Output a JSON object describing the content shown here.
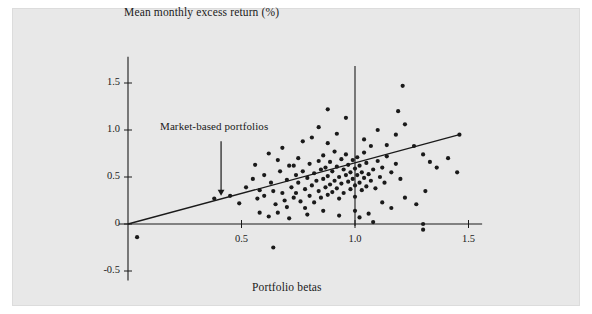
{
  "figure": {
    "background_color": "#e8e8e8",
    "page_color": "#ffffff",
    "ink_color": "#1a1a1a"
  },
  "labels": {
    "ylabel": "Mean monthly excess return (%)",
    "xlabel": "Portfolio betas",
    "annotation": "Market-based portfolios"
  },
  "chart_data": {
    "type": "scatter",
    "title": "",
    "xlabel": "Portfolio betas",
    "ylabel": "Mean monthly excess return (%)",
    "xlim": [
      -0.05,
      1.62
    ],
    "ylim": [
      -0.62,
      1.72
    ],
    "grid": false,
    "legend": null,
    "xticks": [
      0.5,
      1.0,
      1.5
    ],
    "xtick_labels": [
      "0.5",
      "1.0",
      "1.5"
    ],
    "yticks": [
      -0.5,
      0,
      0.5,
      1.0,
      1.5
    ],
    "ytick_labels": [
      "-0.5",
      "0",
      "0.5",
      "1.0",
      "1.5"
    ],
    "annotations": [
      {
        "text": "Market-based portfolios",
        "arrow_x": 0.41,
        "arrow_y_top": 0.88,
        "arrow_y_tip": 0.3
      }
    ],
    "reference_lines": [
      {
        "name": "market-beta-line",
        "orientation": "vertical",
        "x": 1.0,
        "y_from": -0.02,
        "y_to": 1.68
      },
      {
        "name": "x-axis",
        "orientation": "horizontal",
        "y": 0.0,
        "x_from": -0.04,
        "x_to": 1.56
      },
      {
        "name": "y-axis",
        "orientation": "vertical",
        "x": 0.0,
        "y_from": -0.6,
        "y_to": 1.78
      }
    ],
    "fit_line": {
      "name": "regression-line",
      "x_from": 0.0,
      "y_from": 0.0,
      "x_to": 1.46,
      "y_to": 0.95,
      "slope": 0.65,
      "intercept": 0.0
    },
    "points": [
      [
        0.04,
        -0.14
      ],
      [
        0.38,
        0.27
      ],
      [
        0.45,
        0.3
      ],
      [
        0.49,
        0.22
      ],
      [
        0.58,
        0.36
      ],
      [
        0.6,
        0.3
      ],
      [
        0.63,
        0.44
      ],
      [
        0.64,
        0.35
      ],
      [
        0.65,
        0.21
      ],
      [
        0.66,
        0.12
      ],
      [
        0.67,
        0.56
      ],
      [
        0.68,
        0.33
      ],
      [
        0.69,
        0.25
      ],
      [
        0.7,
        0.47
      ],
      [
        0.7,
        0.18
      ],
      [
        0.71,
        0.62
      ],
      [
        0.72,
        0.39
      ],
      [
        0.73,
        0.28
      ],
      [
        0.74,
        0.52
      ],
      [
        0.74,
        0.33
      ],
      [
        0.75,
        0.7
      ],
      [
        0.75,
        0.44
      ],
      [
        0.76,
        0.24
      ],
      [
        0.77,
        0.56
      ],
      [
        0.78,
        0.37
      ],
      [
        0.78,
        0.17
      ],
      [
        0.79,
        0.49
      ],
      [
        0.8,
        0.64
      ],
      [
        0.8,
        0.3
      ],
      [
        0.81,
        0.41
      ],
      [
        0.82,
        0.54
      ],
      [
        0.82,
        0.23
      ],
      [
        0.83,
        0.46
      ],
      [
        0.84,
        0.67
      ],
      [
        0.84,
        0.35
      ],
      [
        0.85,
        0.58
      ],
      [
        0.85,
        0.28
      ],
      [
        0.86,
        0.48
      ],
      [
        0.86,
        0.73
      ],
      [
        0.87,
        0.39
      ],
      [
        0.87,
        0.6
      ],
      [
        0.88,
        0.31
      ],
      [
        0.88,
        0.51
      ],
      [
        0.89,
        0.42
      ],
      [
        0.89,
        0.66
      ],
      [
        0.9,
        0.56
      ],
      [
        0.9,
        0.34
      ],
      [
        0.91,
        0.46
      ],
      [
        0.91,
        0.77
      ],
      [
        0.92,
        0.61
      ],
      [
        0.92,
        0.38
      ],
      [
        0.93,
        0.5
      ],
      [
        0.93,
        0.27
      ],
      [
        0.94,
        0.69
      ],
      [
        0.94,
        0.43
      ],
      [
        0.95,
        0.58
      ],
      [
        0.95,
        0.33
      ],
      [
        0.96,
        0.52
      ],
      [
        0.96,
        0.74
      ],
      [
        0.97,
        0.45
      ],
      [
        0.97,
        0.63
      ],
      [
        0.98,
        0.37
      ],
      [
        0.98,
        0.55
      ],
      [
        0.99,
        0.48
      ],
      [
        0.99,
        0.68
      ],
      [
        1.0,
        0.41
      ],
      [
        1.0,
        0.59
      ],
      [
        1.0,
        0.29
      ],
      [
        1.01,
        0.52
      ],
      [
        1.01,
        0.71
      ],
      [
        1.02,
        0.44
      ],
      [
        1.02,
        0.62
      ],
      [
        1.03,
        0.36
      ],
      [
        1.03,
        0.55
      ],
      [
        1.04,
        0.49
      ],
      [
        1.04,
        0.76
      ],
      [
        1.05,
        0.4
      ],
      [
        1.05,
        0.65
      ],
      [
        1.06,
        0.53
      ],
      [
        1.07,
        0.46
      ],
      [
        1.07,
        0.83
      ],
      [
        1.08,
        0.58
      ],
      [
        1.09,
        0.38
      ],
      [
        1.1,
        0.67
      ],
      [
        1.11,
        0.5
      ],
      [
        1.12,
        0.6
      ],
      [
        1.13,
        0.44
      ],
      [
        1.14,
        0.72
      ],
      [
        1.16,
        0.55
      ],
      [
        1.18,
        0.64
      ],
      [
        1.2,
        0.48
      ],
      [
        0.62,
        0.75
      ],
      [
        0.68,
        0.81
      ],
      [
        0.77,
        0.88
      ],
      [
        0.81,
        0.92
      ],
      [
        0.88,
        0.86
      ],
      [
        0.92,
        0.96
      ],
      [
        0.84,
        1.03
      ],
      [
        0.96,
        1.13
      ],
      [
        0.88,
        1.22
      ],
      [
        1.04,
        0.9
      ],
      [
        1.1,
        1.0
      ],
      [
        1.14,
        0.84
      ],
      [
        1.18,
        0.95
      ],
      [
        1.22,
        1.06
      ],
      [
        1.19,
        1.2
      ],
      [
        1.21,
        1.47
      ],
      [
        1.26,
        0.83
      ],
      [
        1.3,
        0.74
      ],
      [
        1.33,
        0.66
      ],
      [
        1.36,
        0.6
      ],
      [
        1.41,
        0.7
      ],
      [
        1.45,
        0.55
      ],
      [
        1.46,
        0.95
      ],
      [
        0.58,
        0.12
      ],
      [
        0.62,
        0.08
      ],
      [
        0.71,
        0.06
      ],
      [
        0.79,
        0.1
      ],
      [
        0.86,
        0.14
      ],
      [
        0.93,
        0.09
      ],
      [
        1.0,
        0.14
      ],
      [
        1.06,
        0.11
      ],
      [
        1.12,
        0.23
      ],
      [
        1.16,
        0.17
      ],
      [
        1.22,
        0.28
      ],
      [
        1.27,
        0.21
      ],
      [
        1.31,
        0.35
      ],
      [
        1.08,
        0.02
      ],
      [
        1.02,
        0.07
      ],
      [
        0.64,
        -0.25
      ],
      [
        1.3,
        0.0
      ],
      [
        1.3,
        -0.06
      ],
      [
        0.55,
        0.48
      ],
      [
        0.52,
        0.39
      ],
      [
        0.57,
        0.27
      ],
      [
        0.6,
        0.52
      ],
      [
        0.56,
        0.63
      ],
      [
        0.66,
        0.68
      ],
      [
        0.73,
        0.62
      ]
    ]
  }
}
